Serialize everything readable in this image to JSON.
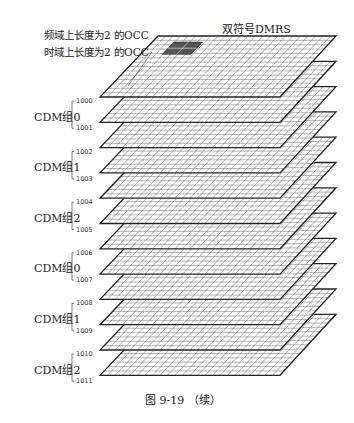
{
  "title": "双符号DMRS",
  "annotations": {
    "freq_occ": "频域上长度为2 的OCC",
    "time_occ": "时域上长度为2 的OCC"
  },
  "groups": [
    {
      "label": "CDM组0",
      "ports": [
        "1000",
        "1001"
      ]
    },
    {
      "label": "CDM组1",
      "ports": [
        "1002",
        "1003"
      ]
    },
    {
      "label": "CDM组2",
      "ports": [
        "1004",
        "1005"
      ]
    },
    {
      "label": "CDM组0",
      "ports": [
        "1006",
        "1007"
      ]
    },
    {
      "label": "CDM组1",
      "ports": [
        "1008",
        "1009"
      ]
    },
    {
      "label": "CDM组2",
      "ports": [
        "1010",
        "1011"
      ]
    }
  ],
  "caption": "图 9-19 （续）",
  "layers": {
    "count": 12,
    "grid_cols": 12,
    "grid_rows": 14,
    "highlight_style": [
      "block",
      "block",
      "block",
      "block",
      "bar",
      "bar",
      "block",
      "block",
      "block",
      "block",
      "bar",
      "bar"
    ]
  },
  "colors": {
    "line": "#222222",
    "grid": "#555555",
    "highlight": "#555555",
    "paper": "#ffffff"
  }
}
